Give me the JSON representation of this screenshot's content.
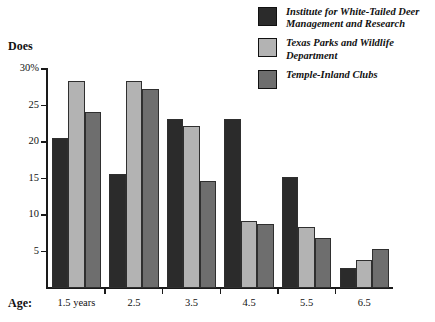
{
  "chart_data": {
    "type": "bar",
    "title": "",
    "subtitle": "",
    "xlabel": "Age:",
    "ylabel": "Does",
    "categories": [
      "1.5 years",
      "2.5",
      "3.5",
      "4.5",
      "5.5",
      "6.5"
    ],
    "ylim": [
      0,
      30
    ],
    "y_ticks": [
      {
        "value": 30,
        "label": "30%"
      },
      {
        "value": 25,
        "label": "25"
      },
      {
        "value": 20,
        "label": "20"
      },
      {
        "value": 15,
        "label": "15"
      },
      {
        "value": 10,
        "label": "10"
      },
      {
        "value": 5,
        "label": "5"
      }
    ],
    "grid": false,
    "legend_position": "top-right",
    "units": "percent",
    "series": [
      {
        "name": "Institute for White-Tailed Deer Management and Research",
        "color": "#2b2b2b",
        "values": [
          20.5,
          15.6,
          23.1,
          23.2,
          15.2,
          2.8
        ]
      },
      {
        "name": "Texas Parks and Wildlife Department",
        "color": "#b3b3b3",
        "values": [
          28.3,
          28.3,
          22.2,
          9.2,
          8.3,
          3.8
        ]
      },
      {
        "name": "Temple-Inland Clubs",
        "color": "#6e6e6e",
        "values": [
          24.1,
          27.2,
          14.7,
          8.7,
          6.8,
          5.3
        ]
      }
    ]
  },
  "legend": {
    "entries": [
      {
        "label": "Institute for White-Tailed Deer\nManagement and Research",
        "color": "#2b2b2b"
      },
      {
        "label": "Texas Parks and Wildlife\nDepartment",
        "color": "#b3b3b3"
      },
      {
        "label": "Temple-Inland Clubs",
        "color": "#6e6e6e"
      }
    ]
  },
  "axes": {
    "y_title": "Does",
    "x_title": "Age:"
  },
  "colors": {
    "series_1": "#2b2b2b",
    "series_2": "#b3b3b3",
    "series_3": "#6e6e6e",
    "axis": "#1a1a1a",
    "background": "#ffffff"
  }
}
